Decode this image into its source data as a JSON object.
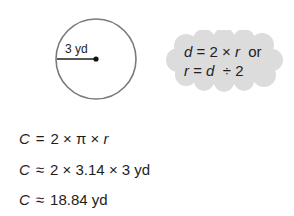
{
  "figure": {
    "radius_label": "3 yd",
    "circle": {
      "cx": 96,
      "cy": 59,
      "r": 40,
      "stroke": "#7a7a7a"
    },
    "center_dot_color": "#111111"
  },
  "note": {
    "line1": {
      "a": "d",
      "b": " = 2 × ",
      "c": "r",
      "d": "  or"
    },
    "line2": {
      "a": "r",
      "b": " = ",
      "c": "d",
      "d": "  ÷ 2"
    },
    "background": "#dcdcdc"
  },
  "equations": [
    {
      "lhs": "C",
      "op": "=",
      "rhs": "2 × π × ",
      "var": "r",
      "tail": ""
    },
    {
      "lhs": "C",
      "op": "≈",
      "rhs": "2 × 3.14 × 3 yd",
      "var": "",
      "tail": ""
    },
    {
      "lhs": "C",
      "op": "≈",
      "rhs": "18.84 yd",
      "var": "",
      "tail": ""
    }
  ]
}
